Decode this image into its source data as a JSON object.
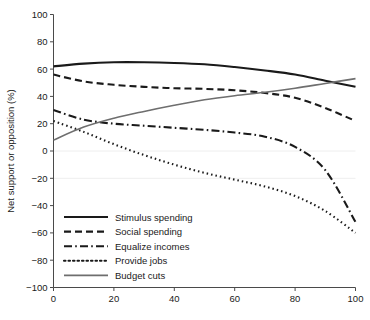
{
  "chart_data": {
    "type": "line",
    "title": "",
    "subtitle": "",
    "xlabel": "",
    "ylabel": "Net support or opposition (%)",
    "xlim": [
      0,
      100
    ],
    "ylim": [
      -100,
      100
    ],
    "xticks": [
      0,
      20,
      40,
      60,
      80,
      100
    ],
    "yticks": [
      100,
      80,
      60,
      40,
      20,
      0,
      -20,
      -40,
      -60,
      -80,
      -100
    ],
    "xtick_labels": [
      "0",
      "20",
      "40",
      "60",
      "80",
      "100"
    ],
    "ytick_labels": [
      "100",
      "80",
      "60",
      "40",
      "20",
      "0",
      "−20",
      "−40",
      "−60",
      "−80",
      "−100"
    ],
    "grid": false,
    "legend_position": "lower-left-inside",
    "x": [
      0,
      10,
      20,
      30,
      40,
      50,
      60,
      70,
      80,
      90,
      100
    ],
    "series": [
      {
        "name": "Stimulus spending",
        "style": "solid",
        "color": "#1a1a1a",
        "width": 2.1,
        "values": [
          62,
          64,
          65,
          65,
          64.5,
          63.5,
          61.5,
          59,
          56,
          51.5,
          47
        ]
      },
      {
        "name": "Social spending",
        "style": "dashed",
        "color": "#1a1a1a",
        "width": 2.1,
        "values": [
          56,
          51,
          48.5,
          47,
          46,
          45.5,
          44.5,
          42.5,
          39,
          31.5,
          22
        ]
      },
      {
        "name": "Equalize incomes",
        "style": "dashdot",
        "color": "#1a1a1a",
        "width": 2.1,
        "values": [
          30,
          23,
          20,
          18.5,
          17,
          15.5,
          13.5,
          10.5,
          3,
          -14,
          -52
        ]
      },
      {
        "name": "Provide jobs",
        "style": "dotted",
        "color": "#1a1a1a",
        "width": 2.1,
        "values": [
          22,
          14,
          5,
          -3,
          -10,
          -16,
          -21,
          -26,
          -33,
          -44,
          -60
        ]
      },
      {
        "name": "Budget cuts",
        "style": "solid",
        "color": "#6e6e6e",
        "width": 1.6,
        "values": [
          8,
          17.5,
          24,
          29,
          33.5,
          37.5,
          40.5,
          43,
          46,
          49.5,
          53
        ]
      }
    ]
  },
  "legend": {
    "items": [
      {
        "label": "Stimulus spending"
      },
      {
        "label": "Social spending"
      },
      {
        "label": "Equalize incomes"
      },
      {
        "label": "Provide jobs"
      },
      {
        "label": "Budget cuts"
      }
    ]
  }
}
